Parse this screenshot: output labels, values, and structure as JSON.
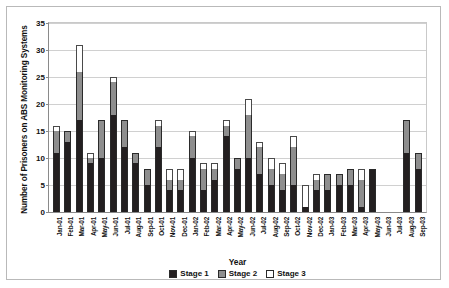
{
  "chart_data": {
    "type": "bar",
    "barmode": "stacked",
    "title": "",
    "xlabel": "Year",
    "ylabel": "Number of Prisoners on ABS Monitoring Systems",
    "ylim": [
      0,
      35
    ],
    "ytick_step": 5,
    "yticks": [
      0,
      5,
      10,
      15,
      20,
      25,
      30,
      35
    ],
    "grid": true,
    "legend_position": "bottom",
    "categories": [
      "Jan-01",
      "Feb-01",
      "Mar-01",
      "Apr-01",
      "May-01",
      "Jun-01",
      "Jul-01",
      "Aug-01",
      "Sep-01",
      "Oct-01",
      "Nov-01",
      "Dec-01",
      "Jan-02",
      "Feb-02",
      "Mar-02",
      "Apr-02",
      "May-02",
      "Jun-02",
      "Jul-02",
      "Aug-02",
      "Sep-02",
      "Oct-02",
      "Nov-02",
      "Dec-02",
      "Jan-03",
      "Feb-03",
      "Mar-03",
      "Apr-03",
      "May-03",
      "Jun-03",
      "Jul-03",
      "Aug-03",
      "Sep-03"
    ],
    "series": [
      {
        "name": "Stage 1",
        "color": "#231f20",
        "values": [
          11,
          13,
          17,
          9,
          10,
          18,
          12,
          9,
          5,
          12,
          4,
          4,
          10,
          4,
          6,
          14,
          8,
          10,
          7,
          5,
          4,
          5,
          1,
          4,
          4,
          5,
          5,
          1,
          8,
          0,
          0,
          11,
          8
        ]
      },
      {
        "name": "Stage 2",
        "color": "#8e8e8e",
        "values": [
          4,
          2,
          9,
          1,
          7,
          6,
          5,
          2,
          3,
          4,
          2,
          2,
          4,
          4,
          2,
          2,
          2,
          8,
          5,
          3,
          3,
          7,
          0,
          2,
          3,
          2,
          3,
          5,
          0,
          0,
          0,
          6,
          3
        ]
      },
      {
        "name": "Stage 3",
        "color": "#ffffff",
        "values": [
          1,
          0,
          5,
          1,
          0,
          1,
          0,
          0,
          0,
          1,
          2,
          2,
          1,
          1,
          1,
          1,
          0,
          3,
          1,
          2,
          2,
          2,
          4,
          1,
          0,
          0,
          0,
          2,
          0,
          0,
          0,
          0,
          0
        ]
      }
    ],
    "totals": [
      16,
      15,
      31,
      11,
      17,
      25,
      17,
      11,
      8,
      17,
      8,
      8,
      15,
      9,
      9,
      17,
      10,
      21,
      13,
      10,
      9,
      14,
      5,
      7,
      7,
      7,
      8,
      8,
      8,
      0,
      0,
      17,
      11
    ]
  },
  "legend": {
    "items": [
      {
        "label": "Stage 1"
      },
      {
        "label": "Stage 2"
      },
      {
        "label": "Stage 3"
      }
    ]
  }
}
